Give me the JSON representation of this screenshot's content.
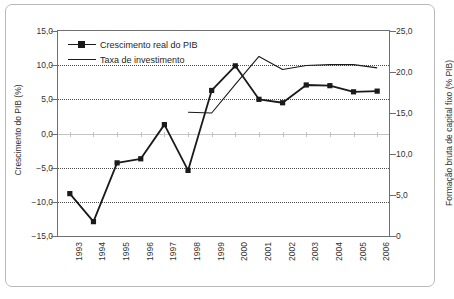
{
  "chart_data": {
    "type": "line",
    "title": "",
    "categories": [
      "1993",
      "1994",
      "1995",
      "1996",
      "1997",
      "1998",
      "1999",
      "2000",
      "2001",
      "2002",
      "2003",
      "2004",
      "2005",
      "2006"
    ],
    "series": [
      {
        "name": "Crescimento real do PIB",
        "axis": "left",
        "marker": "square",
        "values": [
          -8.8,
          -12.9,
          -4.3,
          -3.7,
          1.3,
          -5.4,
          6.3,
          9.9,
          5.0,
          4.5,
          7.1,
          7.0,
          6.1,
          6.2
        ]
      },
      {
        "name": "Taxa de investimento",
        "axis": "right",
        "marker": "none",
        "values": [
          null,
          null,
          null,
          null,
          null,
          15.1,
          15.0,
          18.5,
          21.9,
          20.3,
          20.8,
          20.9,
          20.9,
          20.5
        ]
      }
    ],
    "ylabel": "Crescimento do PIB (%)",
    "ylabel_right": "Formação bruta de capital fixo (% PIB)",
    "xlabel": "",
    "ylim": [
      -15.0,
      15.0
    ],
    "ylim_right": [
      0.0,
      25.0
    ],
    "yticks_left": [
      "15,0",
      "10,0",
      "5,0",
      "0,0",
      "−5,0",
      "−10,0",
      "−15,0"
    ],
    "yticks_left_values": [
      15.0,
      10.0,
      5.0,
      0.0,
      -5.0,
      -10.0,
      -15.0
    ],
    "yticks_right": [
      "25,0",
      "20,0",
      "15,0",
      "10,0",
      "5,0",
      "0"
    ],
    "yticks_right_values": [
      25.0,
      20.0,
      15.0,
      10.0,
      5.0,
      0.0
    ],
    "gridlines_left": [
      10.0,
      5.0,
      -5.0,
      -10.0
    ],
    "grid": true,
    "legend_position": "top-left",
    "colors": {
      "series": "#1a1a1a",
      "grid": "#4a4a4a",
      "zero_axis": "#c3c3c3",
      "frame": "#6f6f6f"
    }
  },
  "legend": {
    "items": [
      {
        "label": "Crescimento real do PIB",
        "symbol": "line-with-square-marker"
      },
      {
        "label": "Taxa de investimento",
        "symbol": "plain-line"
      }
    ]
  }
}
